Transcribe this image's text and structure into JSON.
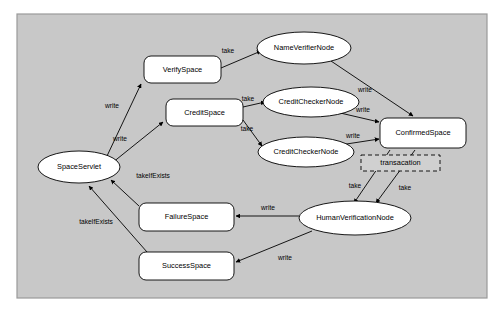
{
  "diagram": {
    "frame": {
      "background_color": "#c8c8c8",
      "border_color": "#9a9a9a",
      "x": 17,
      "y": 14,
      "width": 470,
      "height": 284
    },
    "node_fill": "#ffffff",
    "node_stroke": "#000000",
    "transaction_fill": "#d0d0d0",
    "nodes": [
      {
        "id": "space-servlet",
        "label": "SpaceServlet",
        "shape": "ellipse",
        "cx": 79,
        "cy": 167,
        "rx": 41,
        "ry": 16
      },
      {
        "id": "verify-space",
        "label": "VerifySpace",
        "shape": "rect",
        "x": 144,
        "y": 56,
        "w": 77,
        "h": 27
      },
      {
        "id": "credit-space",
        "label": "CreditSpace",
        "shape": "rect",
        "x": 166,
        "y": 99,
        "w": 77,
        "h": 27
      },
      {
        "id": "name-verifier-node",
        "label": "NameVerifierNode",
        "shape": "ellipse",
        "cx": 304,
        "cy": 48,
        "rx": 47,
        "ry": 16
      },
      {
        "id": "credit-checker-node-1",
        "label": "CreditCheckerNode",
        "shape": "ellipse",
        "cx": 311,
        "cy": 102,
        "rx": 48,
        "ry": 15
      },
      {
        "id": "credit-checker-node-2",
        "label": "CreditCheckerNode",
        "shape": "ellipse",
        "cx": 306,
        "cy": 152,
        "rx": 48,
        "ry": 15
      },
      {
        "id": "confirmed-space",
        "label": "ConfirmedSpace",
        "shape": "rect",
        "x": 380,
        "y": 118,
        "w": 86,
        "h": 30
      },
      {
        "id": "transaction",
        "label": "transacation",
        "shape": "dashed-rect",
        "x": 361,
        "y": 155,
        "w": 79,
        "h": 16
      },
      {
        "id": "human-verification-node",
        "label": "HumanVerificationNode",
        "shape": "ellipse",
        "cx": 355,
        "cy": 218,
        "rx": 56,
        "ry": 17
      },
      {
        "id": "failure-space",
        "label": "FailureSpace",
        "shape": "rect",
        "x": 139,
        "y": 203,
        "w": 95,
        "h": 28
      },
      {
        "id": "success-space",
        "label": "SuccessSpace",
        "shape": "rect",
        "x": 139,
        "y": 252,
        "w": 95,
        "h": 28
      }
    ],
    "edges": [
      {
        "id": "edge-servlet-verifyspace",
        "from": "space-servlet",
        "to": "verify-space",
        "label": "write",
        "x1": 107,
        "y1": 156,
        "x2": 141,
        "y2": 84,
        "lx": 112,
        "ly": 106
      },
      {
        "id": "edge-servlet-creditspace",
        "from": "space-servlet",
        "to": "credit-space",
        "label": "write",
        "x1": 112,
        "y1": 163,
        "x2": 163,
        "y2": 122,
        "lx": 120,
        "ly": 139
      },
      {
        "id": "edge-verifyspace-nameverifier",
        "from": "verify-space",
        "to": "name-verifier-node",
        "label": "take",
        "x1": 221,
        "y1": 68,
        "x2": 261,
        "y2": 51,
        "lx": 228,
        "ly": 51
      },
      {
        "id": "edge-creditspace-checker1",
        "from": "credit-space",
        "to": "credit-checker-node-1",
        "label": "take",
        "x1": 243,
        "y1": 107,
        "x2": 265,
        "y2": 102,
        "lx": 248,
        "ly": 99
      },
      {
        "id": "edge-creditspace-checker2",
        "from": "credit-space",
        "to": "credit-checker-node-2",
        "label": "take",
        "x1": 243,
        "y1": 120,
        "x2": 262,
        "y2": 146,
        "lx": 247,
        "ly": 129
      },
      {
        "id": "edge-nameverifier-confirmed",
        "from": "name-verifier-node",
        "to": "confirmed-space",
        "label": "write",
        "x1": 331,
        "y1": 61,
        "x2": 413,
        "y2": 116,
        "lx": 365,
        "ly": 90
      },
      {
        "id": "edge-checker1-confirmed",
        "from": "credit-checker-node-1",
        "to": "confirmed-space",
        "label": "write",
        "x1": 336,
        "y1": 112,
        "x2": 379,
        "y2": 122,
        "lx": 363,
        "ly": 110
      },
      {
        "id": "edge-checker2-confirmed",
        "from": "credit-checker-node-2",
        "to": "confirmed-space",
        "label": "write",
        "x1": 340,
        "y1": 145,
        "x2": 379,
        "y2": 139,
        "lx": 353,
        "ly": 136
      },
      {
        "id": "edge-confirmed-human-take-left",
        "from": "confirmed-space",
        "to": "human-verification-node",
        "label": "take",
        "x1": 390,
        "y1": 150,
        "x2": 354,
        "y2": 203,
        "lx": 355,
        "ly": 186
      },
      {
        "id": "edge-transaction-human-take",
        "from": "transaction",
        "to": "human-verification-node",
        "label": "take",
        "x1": 415,
        "y1": 150,
        "x2": 376,
        "y2": 203,
        "lx": 405,
        "ly": 188
      },
      {
        "id": "edge-human-failure",
        "from": "human-verification-node",
        "to": "failure-space",
        "label": "write",
        "x1": 299,
        "y1": 216,
        "x2": 236,
        "y2": 216,
        "lx": 268,
        "ly": 208
      },
      {
        "id": "edge-human-success",
        "from": "human-verification-node",
        "to": "success-space",
        "label": "write",
        "x1": 312,
        "y1": 231,
        "x2": 236,
        "y2": 262,
        "lx": 285,
        "ly": 258
      },
      {
        "id": "edge-failure-servlet",
        "from": "failure-space",
        "to": "space-servlet",
        "label": "takeIfExists",
        "x1": 139,
        "y1": 206,
        "x2": 111,
        "y2": 180,
        "lx": 153,
        "ly": 176
      },
      {
        "id": "edge-success-servlet",
        "from": "success-space",
        "to": "space-servlet",
        "label": "takeIfExists",
        "x1": 147,
        "y1": 252,
        "x2": 89,
        "y2": 186,
        "lx": 96,
        "ly": 222
      }
    ]
  }
}
